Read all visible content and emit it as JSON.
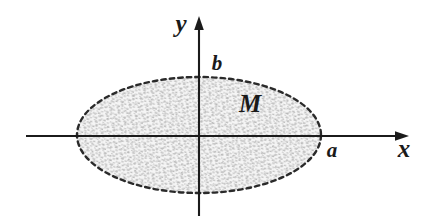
{
  "figure": {
    "background_color": "#ffffff",
    "ink_color": "#1b1b1b",
    "fill_color": "#cfcfcf",
    "width": 427,
    "height": 220
  },
  "axes": {
    "x_axis": {
      "label": "x",
      "label_x": 404,
      "label_y": 157,
      "line_y": 136,
      "line_x_start": 26,
      "line_x_end": 398,
      "arrow_tip_x": 408,
      "has_arrow": true
    },
    "y_axis": {
      "label": "y",
      "label_x": 181,
      "label_y": 32,
      "line_x": 199,
      "line_y_start": 26,
      "line_y_end": 216,
      "arrow_tip_y": 16,
      "has_arrow": true
    },
    "origin": {
      "x": 199,
      "y": 136
    }
  },
  "region": {
    "label": "M",
    "label_x": 250,
    "label_y": 112,
    "shape": "ellipse",
    "center_x": 199,
    "center_y": 135,
    "semi_axis_x": 122,
    "semi_axis_y": 58,
    "boundary_style": "dashed",
    "fill_style": "stipple"
  },
  "markers": [
    {
      "name": "semi-minor-axis-marker",
      "label": "b",
      "label_x": 217,
      "label_y": 70,
      "axis": "y",
      "value_x": 199,
      "value_y": 77
    },
    {
      "name": "semi-major-axis-marker",
      "label": "a",
      "label_x": 332,
      "label_y": 157,
      "axis": "x",
      "value_x": 320,
      "value_y": 136
    }
  ]
}
